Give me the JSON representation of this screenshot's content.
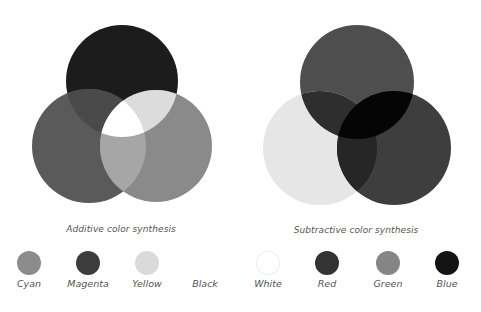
{
  "additive": {
    "caption": "Additive color synthesis",
    "circles": {
      "top": {
        "cx": 122,
        "cy": 81,
        "r": 56,
        "color": "#1c1c1c"
      },
      "left": {
        "cx": 89,
        "cy": 146,
        "r": 57,
        "color": "#5a5a5a"
      },
      "right": {
        "cx": 156,
        "cy": 146,
        "r": 56,
        "color": "#8a8a8a"
      }
    },
    "overlaps": {
      "top_left": "#4a4a4a",
      "top_right": "#dcdcdc",
      "left_right": "#a6a6a6",
      "center": "#ffffff"
    },
    "swatches": [
      {
        "label": "Cyan",
        "x": 29,
        "color": "#8c8c8c",
        "show": true
      },
      {
        "label": "Magenta",
        "x": 88,
        "color": "#3c3c3c",
        "show": true
      },
      {
        "label": "Yellow",
        "x": 147,
        "color": "#dadada",
        "show": true
      },
      {
        "label": "Black",
        "x": 205,
        "color": "#ffffff",
        "show": false
      }
    ]
  },
  "subtractive": {
    "caption": "Subtractive color synthesis",
    "circles": {
      "top": {
        "cx": 357,
        "cy": 82,
        "r": 57,
        "color": "#4e4e4e"
      },
      "left": {
        "cx": 320,
        "cy": 148,
        "r": 57,
        "color": "#e6e6e6"
      },
      "right": {
        "cx": 394,
        "cy": 148,
        "r": 57,
        "color": "#3e3e3e"
      }
    },
    "overlaps": {
      "top_left": "#2e2e2e",
      "top_right": "#050505",
      "left_right": "#262626",
      "center": "#050505"
    },
    "swatches": [
      {
        "label": "White",
        "x": 268,
        "color": "#ffffff",
        "show": true
      },
      {
        "label": "Red",
        "x": 327,
        "color": "#333333",
        "show": true
      },
      {
        "label": "Green",
        "x": 388,
        "color": "#858585",
        "show": true
      },
      {
        "label": "Blue",
        "x": 447,
        "color": "#141414",
        "show": true
      }
    ]
  }
}
